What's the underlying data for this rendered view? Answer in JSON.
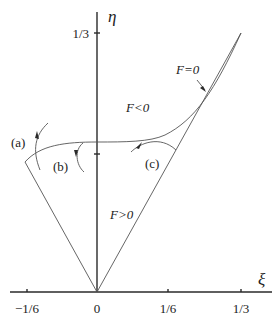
{
  "diagram": {
    "axes": {
      "x_label": "ξ",
      "y_label": "η",
      "x_ticks": [
        "−1/6",
        "0",
        "1/6",
        "1/3"
      ],
      "y_ticks": [
        "1/3"
      ]
    },
    "regions": {
      "boundary": "F=0",
      "inside": "F<0",
      "outside": "F>0"
    },
    "trajectories": {
      "a": "(a)",
      "b": "(b)",
      "c": "(c)"
    },
    "colors": {
      "ink": "#2a2a2a",
      "background": "#ffffff"
    }
  }
}
